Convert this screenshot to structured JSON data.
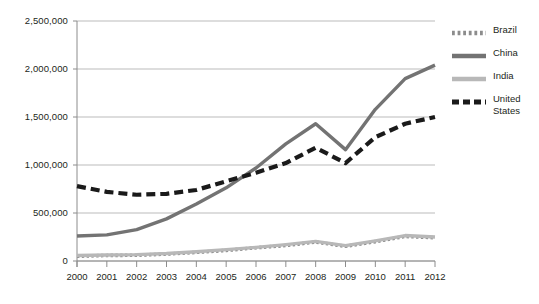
{
  "chart_data": {
    "type": "line",
    "title": "",
    "xlabel": "",
    "ylabel": "",
    "x": [
      2000,
      2001,
      2002,
      2003,
      2004,
      2005,
      2006,
      2007,
      2008,
      2009,
      2010,
      2011,
      2012
    ],
    "categories": [
      "2000",
      "2001",
      "2002",
      "2003",
      "2004",
      "2005",
      "2006",
      "2007",
      "2008",
      "2009",
      "2010",
      "2011",
      "2012"
    ],
    "ylim": [
      0,
      2500000
    ],
    "xlim": [
      2000,
      2012
    ],
    "ytick_labels": [
      "0",
      "500,000",
      "1,000,000",
      "1,500,000",
      "2,000,000",
      "2,500,000"
    ],
    "ytick_values": [
      0,
      500000,
      1000000,
      1500000,
      2000000,
      2500000
    ],
    "grid": "horizontal",
    "legend_position": "right",
    "series": [
      {
        "name": "Brazil",
        "color": "#8c8c8c",
        "style": "dotted",
        "values": [
          50000,
          58000,
          60000,
          72000,
          90000,
          110000,
          138000,
          161000,
          198000,
          153000,
          202000,
          256000,
          243000
        ]
      },
      {
        "name": "China",
        "color": "#737373",
        "style": "solid",
        "values": [
          260000,
          272000,
          326000,
          439000,
          594000,
          762000,
          969000,
          1220000,
          1430000,
          1160000,
          1580000,
          1900000,
          2040000
        ]
      },
      {
        "name": "India",
        "color": "#b8b8b8",
        "style": "solid",
        "values": [
          57000,
          62000,
          66000,
          78000,
          97000,
          119000,
          142000,
          170000,
          204000,
          160000,
          210000,
          265000,
          250000
        ]
      },
      {
        "name": "United States",
        "color": "#1a1a1a",
        "style": "dashed",
        "values": [
          780000,
          720000,
          690000,
          700000,
          740000,
          830000,
          920000,
          1020000,
          1180000,
          1020000,
          1290000,
          1430000,
          1500000
        ]
      }
    ]
  },
  "legend": {
    "items": [
      {
        "label": "Brazil",
        "name": "legend-item-brazil"
      },
      {
        "label": "China",
        "name": "legend-item-china"
      },
      {
        "label": "India",
        "name": "legend-item-india"
      },
      {
        "label": "United\nStates",
        "name": "legend-item-united-states"
      }
    ]
  },
  "axes": {
    "y_labels": [
      "2,500,000",
      "2,000,000",
      "1,500,000",
      "1,000,000",
      "500,000",
      "0"
    ],
    "x_labels": [
      "2000",
      "2001",
      "2002",
      "2003",
      "2004",
      "2005",
      "2006",
      "2007",
      "2008",
      "2009",
      "2010",
      "2011",
      "2012"
    ]
  },
  "colors": {
    "brazil": "#8c8c8c",
    "china": "#737373",
    "india": "#b8b8b8",
    "united_states": "#1a1a1a",
    "grid": "#b3b3b3",
    "axis": "#8c8c8c",
    "text": "#231f20",
    "background": "#ffffff"
  }
}
